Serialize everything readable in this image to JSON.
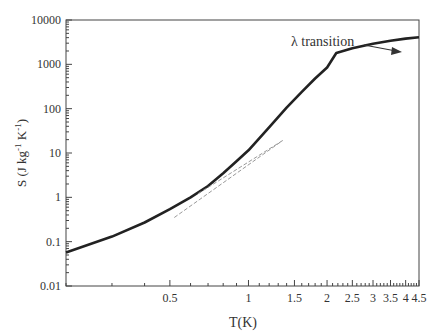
{
  "chart_data": {
    "type": "line",
    "title": "",
    "xlabel": "T(K)",
    "ylabel": "S (J kg-1 K-1)",
    "xscale": "log",
    "yscale": "log",
    "xlim": [
      0.2,
      4.5
    ],
    "ylim": [
      0.01,
      10000
    ],
    "x_ticks": [
      "0.5",
      "1",
      "1.5",
      "2",
      "2.5",
      "3",
      "3.5",
      "4",
      "4.5"
    ],
    "x_tick_values": [
      0.5,
      1,
      1.5,
      2,
      2.5,
      3,
      3.5,
      4,
      4.5
    ],
    "y_ticks": [
      "0.01",
      "0.1",
      "1",
      "10",
      "100",
      "1000",
      "10000"
    ],
    "y_tick_values": [
      0.01,
      0.1,
      1,
      10,
      100,
      1000,
      10000
    ],
    "grid": false,
    "legend": null,
    "series": [
      {
        "name": "S(T)",
        "style": "solid",
        "color": "#222222",
        "x": [
          0.2,
          0.3,
          0.4,
          0.5,
          0.6,
          0.7,
          0.8,
          0.9,
          1.0,
          1.2,
          1.4,
          1.6,
          1.8,
          2.0,
          2.17,
          2.5,
          3.0,
          3.5,
          4.0,
          4.5
        ],
        "y": [
          0.057,
          0.13,
          0.27,
          0.54,
          1.0,
          1.8,
          3.5,
          6.5,
          11.5,
          38,
          105,
          240,
          480,
          850,
          1800,
          2300,
          2900,
          3400,
          3800,
          4100
        ]
      },
      {
        "name": "low-T asymptote",
        "style": "dashed",
        "color": "#999999",
        "x": [
          0.52,
          1.35
        ],
        "y": [
          0.35,
          19
        ]
      },
      {
        "name": "high-T asymptote",
        "style": "dashed",
        "color": "#999999",
        "x": [
          0.64,
          1.35
        ],
        "y": [
          1.2,
          19
        ]
      }
    ],
    "annotations": [
      {
        "text": "λ transition",
        "arrow_to": {
          "x": 2.17,
          "y": 1800
        }
      }
    ]
  },
  "labels": {
    "xlabel": "T(K)",
    "ylabel_main": "S (J kg",
    "ylabel_sup1": "-1",
    "ylabel_mid": " K",
    "ylabel_sup2": "-1",
    "ylabel_end": ")",
    "annotation": "λ transition"
  }
}
